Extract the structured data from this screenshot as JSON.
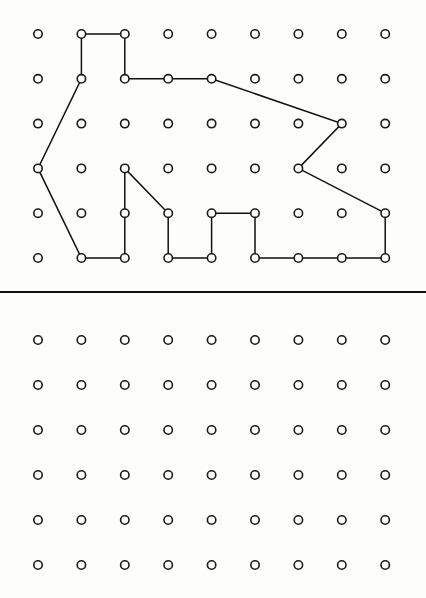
{
  "page": {
    "background_color": "#fdfdfc",
    "width": 426,
    "height": 598
  },
  "divider": {
    "name": "horizontal-rule",
    "color": "#111111",
    "thickness_px": 2,
    "y": 291
  },
  "geoboards": [
    {
      "id": "top-geoboard",
      "label": "Top geoboard with rubber band shape",
      "columns": 9,
      "rows": 6,
      "origin_x": 38,
      "origin_y": 34,
      "spacing_x": 43.4,
      "spacing_y": 44.8,
      "peg_radius": 4.2,
      "peg_fill": "#ffffff",
      "peg_stroke": "#1a1a1a",
      "has_shape": true,
      "shape": {
        "name": "rubber-band-polygon",
        "closed": true,
        "stroke_color": "#111111",
        "stroke_width": 1.5,
        "vertices": [
          [
            1,
            1
          ],
          [
            1,
            0
          ],
          [
            2,
            0
          ],
          [
            2,
            1
          ],
          [
            4,
            1
          ],
          [
            7,
            2
          ],
          [
            6,
            3
          ],
          [
            8,
            4
          ],
          [
            8,
            5
          ],
          [
            5,
            5
          ],
          [
            5,
            4
          ],
          [
            4,
            4
          ],
          [
            4,
            5
          ],
          [
            3,
            5
          ],
          [
            3,
            4
          ],
          [
            2,
            3
          ],
          [
            2,
            5
          ],
          [
            1,
            5
          ],
          [
            0,
            3
          ]
        ]
      }
    },
    {
      "id": "bottom-geoboard",
      "label": "Bottom blank geoboard",
      "columns": 9,
      "rows": 6,
      "origin_x": 38,
      "origin_y": 340,
      "spacing_x": 43.4,
      "spacing_y": 45.0,
      "peg_radius": 4.2,
      "peg_fill": "#ffffff",
      "peg_stroke": "#1a1a1a",
      "has_shape": false,
      "shape": null
    }
  ]
}
